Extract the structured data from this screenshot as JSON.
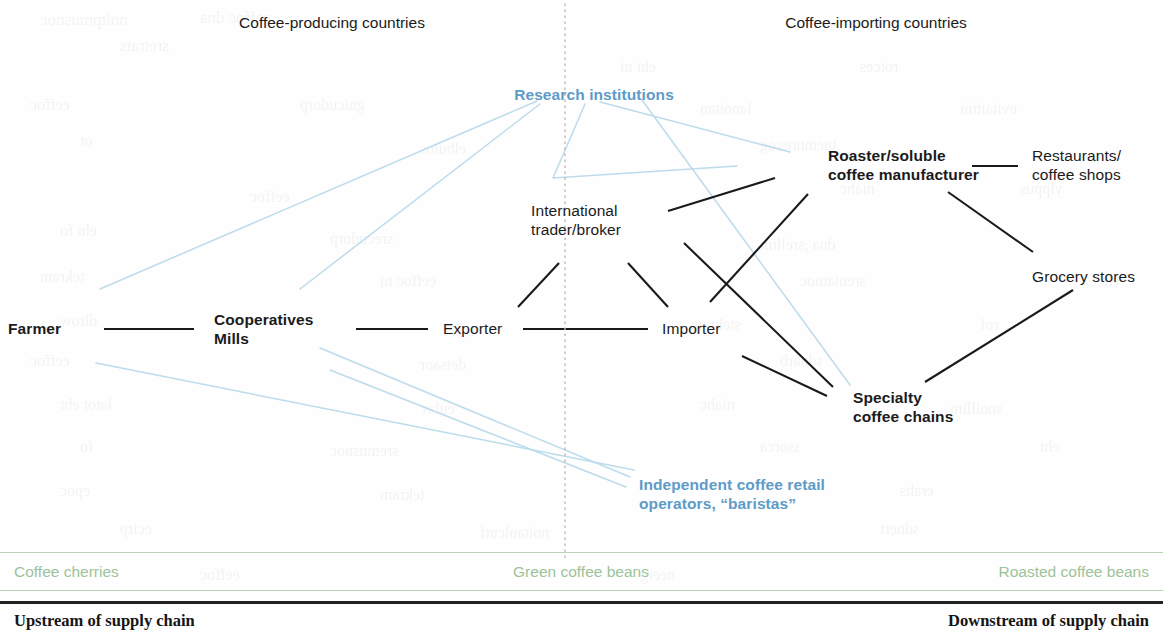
{
  "headers": [
    {
      "label": "Coffee-producing countries",
      "x": 332,
      "y": 14
    },
    {
      "label": "Coffee-importing countries",
      "x": 876,
      "y": 14
    }
  ],
  "divider": {
    "x": 565,
    "y1": 4,
    "y2": 561,
    "color": "#c9b6ad",
    "style": "dotted"
  },
  "colors": {
    "node_text": "#1b1b1b",
    "blue_accent": "#5f9bc7",
    "green_band": "#9cc39a",
    "green_rule": "#b7d4b3",
    "black_link": "#1a1a1a",
    "blue_link": "#bcdbeb",
    "black_rule": "#222222"
  },
  "nodes": [
    {
      "id": "farmer",
      "label": "Farmer",
      "x": 8,
      "y": 319,
      "bold": true,
      "align": "left",
      "color": "black"
    },
    {
      "id": "cooperatives",
      "label": "Cooperatives\nMills",
      "x": 214,
      "y": 310,
      "bold": true,
      "align": "left",
      "color": "black"
    },
    {
      "id": "exporter",
      "label": "Exporter",
      "x": 443,
      "y": 319,
      "bold": false,
      "align": "left",
      "color": "black"
    },
    {
      "id": "importer",
      "label": "Importer",
      "x": 662,
      "y": 319,
      "bold": false,
      "align": "left",
      "color": "black"
    },
    {
      "id": "trader",
      "label": "International\ntrader/broker",
      "x": 531,
      "y": 201,
      "bold": false,
      "align": "left",
      "color": "black"
    },
    {
      "id": "roaster",
      "label": "Roaster/soluble\ncoffee manufacturer",
      "x": 828,
      "y": 146,
      "bold": true,
      "align": "left",
      "color": "black"
    },
    {
      "id": "restaurants",
      "label": "Restaurants/\ncoffee shops",
      "x": 1032,
      "y": 146,
      "bold": false,
      "align": "left",
      "color": "black"
    },
    {
      "id": "grocery",
      "label": "Grocery stores",
      "x": 1032,
      "y": 267,
      "bold": false,
      "align": "left",
      "color": "black"
    },
    {
      "id": "specialty",
      "label": "Specialty\ncoffee chains",
      "x": 853,
      "y": 388,
      "bold": true,
      "align": "left",
      "color": "black"
    },
    {
      "id": "research",
      "label": "Research institutions",
      "x": 594,
      "y": 85,
      "bold": true,
      "align": "center",
      "color": "blue"
    },
    {
      "id": "baristas",
      "label": "Independent coffee retail\noperators, “baristas”",
      "x": 639,
      "y": 475,
      "bold": true,
      "align": "left",
      "color": "blue"
    }
  ],
  "links_black": [
    {
      "from": "farmer",
      "to": "cooperatives",
      "x1": 104,
      "y1": 329,
      "x2": 194,
      "y2": 329
    },
    {
      "from": "cooperatives",
      "to": "exporter",
      "x1": 356,
      "y1": 329,
      "x2": 428,
      "y2": 329
    },
    {
      "from": "exporter",
      "to": "importer",
      "x1": 523,
      "y1": 329,
      "x2": 648,
      "y2": 329
    },
    {
      "from": "exporter",
      "to": "trader",
      "x1": 518,
      "y1": 307,
      "x2": 559,
      "y2": 263
    },
    {
      "from": "trader",
      "to": "importer",
      "x1": 628,
      "y1": 263,
      "x2": 668,
      "y2": 307
    },
    {
      "from": "trader",
      "to": "roaster",
      "x1": 668,
      "y1": 211,
      "x2": 775,
      "y2": 178
    },
    {
      "from": "trader",
      "to": "specialty",
      "x1": 684,
      "y1": 243,
      "x2": 833,
      "y2": 387
    },
    {
      "from": "importer",
      "to": "roaster",
      "x1": 710,
      "y1": 302,
      "x2": 808,
      "y2": 194
    },
    {
      "from": "importer",
      "to": "specialty",
      "x1": 742,
      "y1": 356,
      "x2": 827,
      "y2": 396
    },
    {
      "from": "roaster",
      "to": "restaurants",
      "x1": 972,
      "y1": 166,
      "x2": 1018,
      "y2": 166
    },
    {
      "from": "roaster",
      "to": "grocery",
      "x1": 948,
      "y1": 192,
      "x2": 1033,
      "y2": 252
    },
    {
      "from": "specialty",
      "to": "grocery",
      "x1": 925,
      "y1": 382,
      "x2": 1073,
      "y2": 290
    }
  ],
  "links_blue": [
    {
      "from": "research",
      "to": "farmer",
      "points": "537,101 100,289"
    },
    {
      "from": "research",
      "to": "cooperatives",
      "points": "540,104 300,289"
    },
    {
      "from": "research",
      "to": "exporter",
      "points": "585,104 553,178 737,166"
    },
    {
      "from": "research",
      "to": "roaster",
      "points": "600,102 790,152"
    },
    {
      "from": "research",
      "to": "specialty",
      "points": "642,100 850,385"
    },
    {
      "from": "farmer",
      "to": "baristas",
      "points": "96,363 634,470"
    },
    {
      "from": "coops",
      "to": "baristas",
      "points": "320,348 630,477"
    },
    {
      "from": "coops2",
      "to": "baristas",
      "points": "330,370 626,487"
    }
  ],
  "green_band": {
    "y": 552,
    "labels": [
      {
        "label": "Coffee cherries",
        "x": 14,
        "align": "left"
      },
      {
        "label": "Green coffee beans",
        "x": 581,
        "align": "center"
      },
      {
        "label": "Roasted coffee beans",
        "x": 1149,
        "align": "right"
      }
    ]
  },
  "bottom": {
    "rule_y": 601,
    "left_label": "Upstream of supply chain",
    "right_label": "Downstream of supply chain",
    "left_x": 14,
    "right_x": 1149,
    "y": 611
  },
  "bleedthrough": [
    {
      "t": "noitpmusnoc",
      "x": 40,
      "y": 10,
      "s": 17
    },
    {
      "t": "eeffoc dna",
      "x": 200,
      "y": 8,
      "s": 17
    },
    {
      "t": "sretrats",
      "x": 120,
      "y": 36,
      "s": 17
    },
    {
      "t": "eht ni",
      "x": 620,
      "y": 58,
      "s": 16
    },
    {
      "t": "rotces",
      "x": 860,
      "y": 58,
      "s": 16
    },
    {
      "t": "eeffoc",
      "x": 30,
      "y": 96,
      "s": 16
    },
    {
      "t": "gnicudorp",
      "x": 300,
      "y": 96,
      "s": 16
    },
    {
      "t": "lanoitan",
      "x": 700,
      "y": 100,
      "s": 16
    },
    {
      "t": "evitaitini",
      "x": 960,
      "y": 100,
      "s": 16
    },
    {
      "t": "ot",
      "x": 80,
      "y": 132,
      "s": 16
    },
    {
      "t": "elbulos",
      "x": 420,
      "y": 140,
      "s": 16
    },
    {
      "t": "tnemnrevog",
      "x": 760,
      "y": 136,
      "s": 16
    },
    {
      "t": "eeffoc",
      "x": 250,
      "y": 188,
      "s": 16
    },
    {
      "t": "niahc",
      "x": 840,
      "y": 180,
      "s": 16
    },
    {
      "t": "ylppus",
      "x": 1020,
      "y": 180,
      "s": 16
    },
    {
      "t": "eht fo",
      "x": 60,
      "y": 222,
      "s": 16
    },
    {
      "t": "srecudorp",
      "x": 330,
      "y": 230,
      "s": 16
    },
    {
      "t": "dna ,srellim",
      "x": 760,
      "y": 236,
      "s": 16
    },
    {
      "t": "tekram",
      "x": 40,
      "y": 268,
      "s": 16
    },
    {
      "t": "eeffoc ni",
      "x": 380,
      "y": 272,
      "s": 16
    },
    {
      "t": "sreniatnoc",
      "x": 800,
      "y": 272,
      "s": 16
    },
    {
      "t": "eht",
      "x": 1100,
      "y": 272,
      "s": 16
    },
    {
      "t": "dlrow",
      "x": 60,
      "y": 312,
      "s": 16
    },
    {
      "t": "stekram",
      "x": 690,
      "y": 316,
      "s": 16
    },
    {
      "t": "rof",
      "x": 980,
      "y": 316,
      "s": 16
    },
    {
      "t": "eeffoc",
      "x": 30,
      "y": 352,
      "s": 16
    },
    {
      "t": "detsaor",
      "x": 420,
      "y": 356,
      "s": 16
    },
    {
      "t": "sdnarb",
      "x": 780,
      "y": 352,
      "s": 16
    },
    {
      "t": "latot eht",
      "x": 60,
      "y": 396,
      "s": 16
    },
    {
      "t": "eulav",
      "x": 420,
      "y": 400,
      "s": 16
    },
    {
      "t": "niahc",
      "x": 700,
      "y": 396,
      "s": 16
    },
    {
      "t": "snoillim",
      "x": 950,
      "y": 400,
      "s": 16
    },
    {
      "t": "fo",
      "x": 80,
      "y": 438,
      "s": 16
    },
    {
      "t": "sremusnoc",
      "x": 330,
      "y": 442,
      "s": 16
    },
    {
      "t": "ssorca",
      "x": 760,
      "y": 438,
      "s": 16
    },
    {
      "t": "eht",
      "x": 1040,
      "y": 438,
      "s": 16
    },
    {
      "t": "epoc",
      "x": 60,
      "y": 482,
      "s": 16
    },
    {
      "t": "tekram",
      "x": 380,
      "y": 486,
      "s": 16
    },
    {
      "t": "erahs",
      "x": 900,
      "y": 482,
      "s": 16
    },
    {
      "t": "ecirp",
      "x": 120,
      "y": 520,
      "s": 16
    },
    {
      "t": "noitaulcutf",
      "x": 480,
      "y": 524,
      "s": 16
    },
    {
      "t": "sdnert",
      "x": 880,
      "y": 520,
      "s": 16
    },
    {
      "t": "eeffoc",
      "x": 200,
      "y": 566,
      "s": 16
    },
    {
      "t": "neerg",
      "x": 640,
      "y": 566,
      "s": 16
    }
  ]
}
